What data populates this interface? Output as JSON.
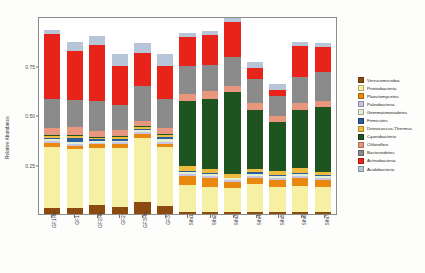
{
  "chart_data": {
    "type": "bar",
    "subtype": "stacked-bar",
    "title": "",
    "xlabel": "",
    "ylabel": "Relative Abundance",
    "ylim": [
      0,
      1.0
    ],
    "yticks": [
      0.25,
      0.5,
      0.75
    ],
    "ytick_labels": [
      "0.25",
      "0.50",
      "0.75"
    ],
    "grid": false,
    "legend_position": "right",
    "stacked_order_bottom_to_top": [
      "Verrucomicrobia",
      "Proteobacteria",
      "Planctomycetes",
      "Paleobacteria",
      "Gemmatimonadetes",
      "Firmicutes",
      "Deinococcus-Thermus",
      "Cyanobacteria",
      "Chloroflexi",
      "Bacteroidetes",
      "Actinobacteria",
      "Acidobacteria"
    ],
    "categories": [
      "GF1Rh",
      "GF1",
      "GF2Rh",
      "GF2",
      "GF3Rh",
      "GF3",
      "Sihi1",
      "Sihi2",
      "Sihi3",
      "Sihi4",
      "Sihi5",
      "Sihi6",
      "Sihi7"
    ],
    "series": [
      {
        "name": "Verrucomicrobia",
        "color": "#8c4a0e",
        "values": [
          0.03,
          0.03,
          0.045,
          0.035,
          0.06,
          0.04,
          0.012,
          0.01,
          0.01,
          0.012,
          0.01,
          0.01,
          0.012
        ]
      },
      {
        "name": "Proteobacteria",
        "color": "#f5f0a3",
        "values": [
          0.31,
          0.3,
          0.29,
          0.3,
          0.33,
          0.3,
          0.135,
          0.13,
          0.125,
          0.14,
          0.13,
          0.135,
          0.125
        ]
      },
      {
        "name": "Planctomycetes",
        "color": "#e8880f",
        "values": [
          0.02,
          0.018,
          0.022,
          0.02,
          0.02,
          0.018,
          0.045,
          0.042,
          0.035,
          0.03,
          0.035,
          0.04,
          0.035
        ]
      },
      {
        "name": "Paleobacteria",
        "color": "#c9c2e0",
        "values": [
          0.012,
          0.01,
          0.008,
          0.01,
          0.008,
          0.012,
          0.01,
          0.01,
          0.008,
          0.012,
          0.01,
          0.008,
          0.01
        ]
      },
      {
        "name": "Gemmatimonadetes",
        "color": "#e2eed2",
        "values": [
          0.01,
          0.012,
          0.01,
          0.01,
          0.01,
          0.014,
          0.012,
          0.01,
          0.01,
          0.012,
          0.01,
          0.012,
          0.01
        ]
      },
      {
        "name": "Firmicutes",
        "color": "#2a5d9e",
        "values": [
          0.008,
          0.018,
          0.006,
          0.008,
          0.006,
          0.01,
          0.006,
          0.005,
          0.005,
          0.006,
          0.005,
          0.006,
          0.005
        ]
      },
      {
        "name": "Deinococcus-Thermus",
        "color": "#efbb3c",
        "values": [
          0.008,
          0.008,
          0.008,
          0.008,
          0.008,
          0.008,
          0.025,
          0.022,
          0.02,
          0.02,
          0.022,
          0.022,
          0.02
        ]
      },
      {
        "name": "Cyanobacteria",
        "color": "#1d5420",
        "values": [
          0.006,
          0.006,
          0.006,
          0.006,
          0.006,
          0.006,
          0.33,
          0.36,
          0.43,
          0.3,
          0.25,
          0.3,
          0.33
        ]
      },
      {
        "name": "Chloroflexi",
        "color": "#e8977e",
        "values": [
          0.035,
          0.04,
          0.03,
          0.03,
          0.028,
          0.03,
          0.04,
          0.04,
          0.035,
          0.035,
          0.03,
          0.035,
          0.03
        ]
      },
      {
        "name": "Bacteroidetes",
        "color": "#8b8b8b",
        "values": [
          0.15,
          0.14,
          0.15,
          0.13,
          0.175,
          0.15,
          0.14,
          0.13,
          0.15,
          0.12,
          0.1,
          0.13,
          0.15
        ]
      },
      {
        "name": "Actinobacteria",
        "color": "#e8241a",
        "values": [
          0.33,
          0.25,
          0.29,
          0.2,
          0.17,
          0.17,
          0.15,
          0.155,
          0.185,
          0.06,
          0.03,
          0.16,
          0.125
        ]
      },
      {
        "name": "Acidobacteria",
        "color": "#b6c6d8",
        "values": [
          0.02,
          0.045,
          0.045,
          0.06,
          0.05,
          0.06,
          0.02,
          0.018,
          0.022,
          0.028,
          0.03,
          0.02,
          0.022
        ]
      }
    ]
  },
  "axes": {
    "y_title": "Relative Abundance"
  }
}
